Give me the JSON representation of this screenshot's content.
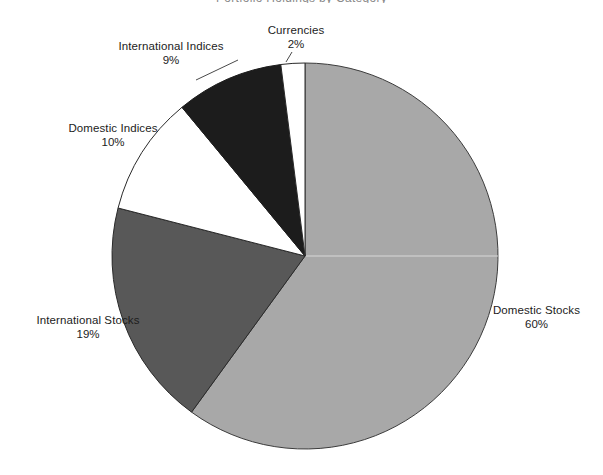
{
  "chart_data": {
    "type": "pie",
    "title": "Portfolio Holdings by Category",
    "xlabel": "",
    "ylabel": "",
    "legend_position": "none",
    "grid": false,
    "start_angle_deg": 0,
    "direction": "clockwise",
    "categories": [
      "Domestic Stocks",
      "International Stocks",
      "Domestic Indices",
      "International Indices",
      "Currencies"
    ],
    "values": [
      60,
      19,
      10,
      9,
      2
    ],
    "value_unit": "%",
    "slices": [
      {
        "label": "Domestic Stocks",
        "percent": "60%",
        "value": 60,
        "color": "#a8a8a8",
        "stroke": "#3c3c3c",
        "start_deg": 0,
        "end_deg": 216
      },
      {
        "label": "International Stocks",
        "percent": "19%",
        "value": 19,
        "color": "#585858",
        "stroke": "#2a2a2a",
        "start_deg": 216,
        "end_deg": 284.4
      },
      {
        "label": "Domestic Indices",
        "percent": "10%",
        "value": 10,
        "color": "#ffffff",
        "stroke": "#2a2a2a",
        "start_deg": 284.4,
        "end_deg": 320.4
      },
      {
        "label": "International Indices",
        "percent": "9%",
        "value": 9,
        "color": "#1c1c1c",
        "stroke": "#1c1c1c",
        "start_deg": 320.4,
        "end_deg": 352.8
      },
      {
        "label": "Currencies",
        "percent": "2%",
        "value": 2,
        "color": "#ffffff",
        "stroke": "#2a2a2a",
        "start_deg": 352.8,
        "end_deg": 360
      }
    ],
    "geometry": {
      "center_x": 305,
      "center_y": 256,
      "radius": 193
    },
    "colors": {
      "domestic_stocks": "#a8a8a8",
      "international_stocks": "#585858",
      "domestic_indices": "#ffffff",
      "international_indices": "#1c1c1c",
      "currencies": "#ffffff",
      "outline": "#2a2a2a",
      "background": "#ffffff",
      "label_text": "#1c1c1c"
    }
  }
}
